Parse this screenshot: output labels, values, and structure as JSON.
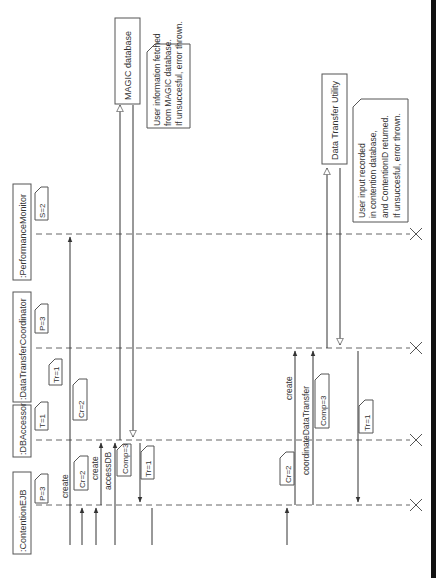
{
  "diagram": {
    "type": "sequence-diagram",
    "orientation": "rotated-90-ccw",
    "lifelines": [
      {
        "id": "contention-ejb",
        "label": ":ContentionEJB",
        "tag": "P=3"
      },
      {
        "id": "db-accessor",
        "label": ":DBAccessor",
        "tag": "T=1"
      },
      {
        "id": "data-transfer-coordinator",
        "label": ":DataTransferCoordinator",
        "tag": "P=3"
      },
      {
        "id": "performance-monitor",
        "label": ":PerformanceMonitor",
        "tag": "S=2"
      }
    ],
    "external_boxes": [
      {
        "id": "magic-database",
        "label": "MAGIC database"
      },
      {
        "id": "data-transfer-utility",
        "label": "Data Transfer Utility"
      }
    ],
    "notes": [
      {
        "id": "note-magic",
        "lines": [
          "User information fetched",
          "from MAGIC database.",
          "If unsuccesful, error thrown."
        ]
      },
      {
        "id": "note-dtu",
        "lines": [
          "User input recorded",
          "in contention database,",
          "and ContentionID returned.",
          "If unsuccesful, error thrown."
        ]
      }
    ],
    "messages": [
      {
        "id": "msg-create-1",
        "label": "create",
        "tag": "Cr=2"
      },
      {
        "id": "msg-create-pm",
        "label": "",
        "tag": "Cr=2"
      },
      {
        "id": "msg-create-2",
        "label": "create",
        "tag": ""
      },
      {
        "id": "msg-accessdb",
        "label": "accessDB",
        "tag": "Comp=3"
      },
      {
        "id": "msg-return-1",
        "label": "",
        "tag": "Tr=1"
      },
      {
        "id": "msg-tr-dtc",
        "label": "",
        "tag": "Tr=1"
      },
      {
        "id": "msg-create-3",
        "label": "create",
        "tag": "Cr=2"
      },
      {
        "id": "msg-coordinate",
        "label": "coordinateDataTransfer",
        "tag": "Comp=3"
      },
      {
        "id": "msg-return-2",
        "label": "",
        "tag": "Tr=1"
      }
    ]
  }
}
